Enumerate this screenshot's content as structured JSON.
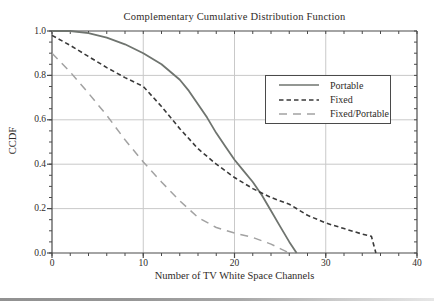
{
  "chart_data": {
    "type": "line",
    "title": "Complementary Cumulative Distribution Function",
    "xlabel": "Number of TV White Space Channels",
    "ylabel": "CCDF",
    "xlim": [
      0,
      40
    ],
    "ylim": [
      0.0,
      1.0
    ],
    "x_ticks": [
      "0",
      "10",
      "20",
      "30",
      "40"
    ],
    "y_ticks": [
      "0.0",
      "0.2",
      "0.4",
      "0.6",
      "0.8",
      "1.0"
    ],
    "x_minor_step": 2,
    "y_minor_step": 0.05,
    "grid": true,
    "legend_position": "upper right",
    "series": [
      {
        "name": "Portable",
        "style": "solid",
        "color": "#6f746f",
        "points": [
          [
            0,
            1.0
          ],
          [
            2,
            1.0
          ],
          [
            4,
            0.99
          ],
          [
            5,
            0.98
          ],
          [
            6,
            0.97
          ],
          [
            8,
            0.94
          ],
          [
            10,
            0.9
          ],
          [
            12,
            0.85
          ],
          [
            14,
            0.78
          ],
          [
            15,
            0.73
          ],
          [
            16,
            0.67
          ],
          [
            17,
            0.61
          ],
          [
            18,
            0.54
          ],
          [
            19,
            0.48
          ],
          [
            20,
            0.42
          ],
          [
            21,
            0.37
          ],
          [
            22,
            0.32
          ],
          [
            23,
            0.26
          ],
          [
            24,
            0.19
          ],
          [
            25,
            0.12
          ],
          [
            26,
            0.05
          ],
          [
            26.8,
            0.0
          ]
        ]
      },
      {
        "name": "Fixed",
        "style": "dashed",
        "color": "#3a3a3a",
        "points": [
          [
            0,
            0.98
          ],
          [
            2,
            0.935
          ],
          [
            4,
            0.885
          ],
          [
            6,
            0.835
          ],
          [
            8,
            0.79
          ],
          [
            10,
            0.75
          ],
          [
            12,
            0.66
          ],
          [
            14,
            0.56
          ],
          [
            16,
            0.47
          ],
          [
            18,
            0.4
          ],
          [
            20,
            0.34
          ],
          [
            22,
            0.29
          ],
          [
            24,
            0.25
          ],
          [
            26,
            0.22
          ],
          [
            28,
            0.17
          ],
          [
            30,
            0.135
          ],
          [
            32,
            0.11
          ],
          [
            34,
            0.085
          ],
          [
            35,
            0.075
          ],
          [
            35.5,
            0.0
          ]
        ]
      },
      {
        "name": "Fixed/Portable",
        "style": "long-dash",
        "color": "#a2a2a2",
        "points": [
          [
            0,
            0.9
          ],
          [
            2,
            0.815
          ],
          [
            4,
            0.72
          ],
          [
            6,
            0.62
          ],
          [
            8,
            0.51
          ],
          [
            10,
            0.41
          ],
          [
            12,
            0.32
          ],
          [
            14,
            0.235
          ],
          [
            16,
            0.16
          ],
          [
            18,
            0.115
          ],
          [
            20,
            0.09
          ],
          [
            22,
            0.07
          ],
          [
            23,
            0.055
          ],
          [
            24,
            0.04
          ],
          [
            25,
            0.02
          ],
          [
            26,
            0.0
          ]
        ]
      }
    ]
  },
  "colors": {
    "grid": "#c9c9c9",
    "axis": "#4a4a4a",
    "text": "#2f2b28",
    "background": "#ffffff"
  }
}
